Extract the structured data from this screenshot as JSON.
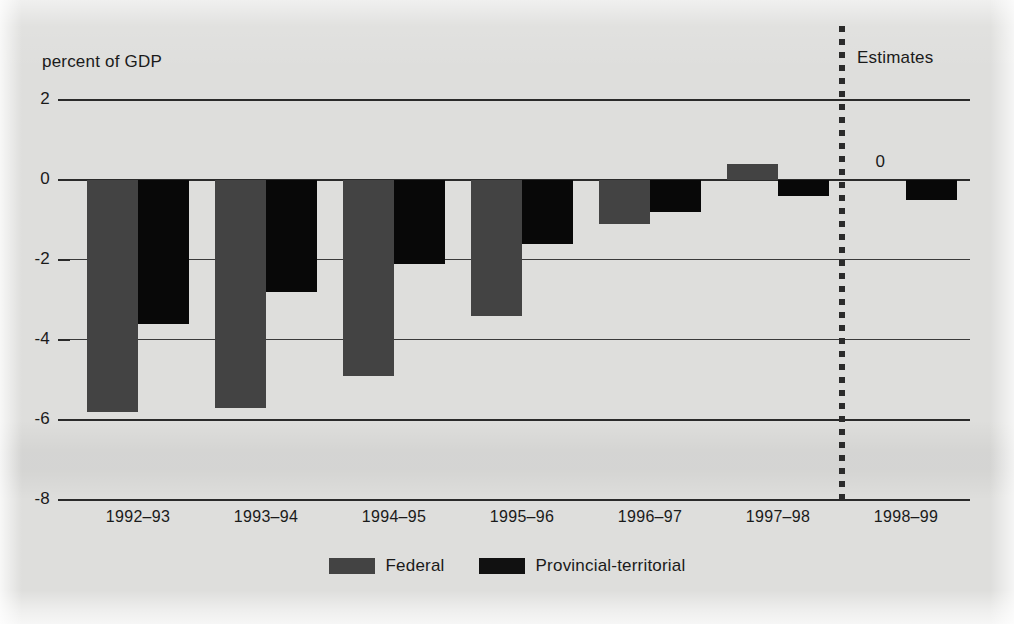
{
  "chart_data": {
    "type": "bar",
    "title": "",
    "subtitle": "",
    "ylabel": "percent of GDP",
    "xlabel": "",
    "ylim": [
      -8,
      2
    ],
    "yticks": [
      2,
      0,
      -2,
      -4,
      -6,
      -8
    ],
    "ytick_labels": [
      "2",
      "0",
      "-2",
      "-4",
      "-6",
      "-8"
    ],
    "grid": true,
    "legend_position": "bottom-center",
    "categories": [
      "1992–93",
      "1993–94",
      "1994–95",
      "1995–96",
      "1996–97",
      "1997–98",
      "1998–99"
    ],
    "series": [
      {
        "name": "Federal",
        "color": "#434343",
        "values": [
          -5.8,
          -5.7,
          -4.9,
          -3.4,
          -1.1,
          0.4,
          0.0
        ]
      },
      {
        "name": "Provincial-territorial",
        "color": "#111111",
        "values": [
          -3.6,
          -2.8,
          -2.1,
          -1.6,
          -0.8,
          -0.4,
          -0.5
        ]
      }
    ],
    "annotations": [
      {
        "text": "Estimates",
        "kind": "region-label"
      },
      {
        "text": "0",
        "kind": "value-label",
        "series": "Federal",
        "category": "1998–99"
      }
    ],
    "divider": {
      "label": "Estimates",
      "style": "dotted-vertical",
      "after_category": "1997–98"
    }
  },
  "legend": {
    "entries": [
      {
        "label": "Federal",
        "color": "#434343"
      },
      {
        "label": "Provincial-territorial",
        "color": "#111111"
      }
    ]
  },
  "colors": {
    "background": "#dededc",
    "axis": "#2a2a2a",
    "text": "#1a1a1a",
    "federal": "#434343",
    "provincial": "#111111"
  }
}
